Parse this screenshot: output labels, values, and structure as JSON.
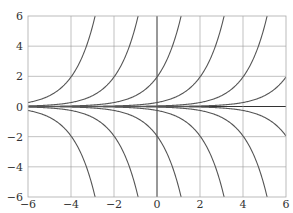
{
  "chart_data": {
    "type": "line",
    "title": "",
    "xlabel": "",
    "ylabel": "",
    "xlim": [
      -6,
      6
    ],
    "ylim": [
      -6,
      6
    ],
    "grid": true,
    "x_ticks": [
      "−6",
      "−4",
      "−2",
      "0",
      "2",
      "4",
      "6"
    ],
    "y_ticks": [
      "6",
      "4",
      "2",
      "0",
      "−2",
      "−4",
      "−6"
    ],
    "series": [
      {
        "name": "y = e^(x+4.67)",
        "sign": 1,
        "k": 4.67
      },
      {
        "name": "y = e^(x+2.67)",
        "sign": 1,
        "k": 2.67
      },
      {
        "name": "y = e^(x+0.67)",
        "sign": 1,
        "k": 0.67
      },
      {
        "name": "y = e^(x-1.33)",
        "sign": 1,
        "k": -1.33
      },
      {
        "name": "y = e^(x-3.33)",
        "sign": 1,
        "k": -3.33
      },
      {
        "name": "y = e^(x-5.33)",
        "sign": 1,
        "k": -5.33
      },
      {
        "name": "y = -e^(x+4.67)",
        "sign": -1,
        "k": 4.67
      },
      {
        "name": "y = -e^(x+2.67)",
        "sign": -1,
        "k": 2.67
      },
      {
        "name": "y = -e^(x+0.67)",
        "sign": -1,
        "k": 0.67
      },
      {
        "name": "y = -e^(x-1.33)",
        "sign": -1,
        "k": -1.33
      },
      {
        "name": "y = -e^(x-3.33)",
        "sign": -1,
        "k": -3.33
      },
      {
        "name": "y = -e^(x-5.33)",
        "sign": -1,
        "k": -5.33
      }
    ]
  },
  "colors": {
    "curve": "#555555",
    "grid": "#999999",
    "axis": "#333333"
  }
}
